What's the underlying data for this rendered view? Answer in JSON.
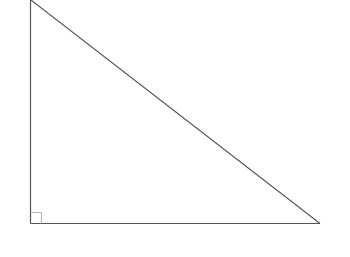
{
  "diagram": {
    "type": "right-triangle",
    "stroke_color": "#555555",
    "background": "#ffffff",
    "vertices": {
      "top": [
        30,
        0
      ],
      "right_angle": [
        30,
        223
      ],
      "bottom_right": [
        320,
        223
      ]
    },
    "right_angle_marker": {
      "size": 11
    }
  }
}
